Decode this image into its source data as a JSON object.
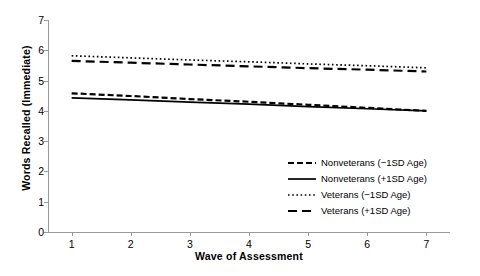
{
  "chart_data": {
    "type": "line",
    "title": "",
    "xlabel": "Wave of Assessment",
    "ylabel": "Words Recalled (Immediate)",
    "x": [
      1,
      2,
      3,
      4,
      5,
      6,
      7
    ],
    "xlim": [
      0.6,
      7.4
    ],
    "ylim": [
      0,
      7
    ],
    "xticks": [
      "1",
      "2",
      "3",
      "4",
      "5",
      "6",
      "7"
    ],
    "yticks": [
      "0",
      "1",
      "2",
      "3",
      "4",
      "5",
      "6",
      "7"
    ],
    "grid": false,
    "legend_position": "lower right",
    "series": [
      {
        "name": "Nonveterans (−1SD Age)",
        "style": "dashed",
        "color": "#000000",
        "values": [
          4.58,
          4.49,
          4.39,
          4.3,
          4.2,
          4.1,
          4.0
        ]
      },
      {
        "name": "Nonveterans (+1SD Age)",
        "style": "solid",
        "color": "#000000",
        "values": [
          4.43,
          4.36,
          4.29,
          4.22,
          4.14,
          4.07,
          4.0
        ]
      },
      {
        "name": "Veterans (−1SD Age)",
        "style": "dotted",
        "color": "#000000",
        "values": [
          5.82,
          5.75,
          5.68,
          5.62,
          5.55,
          5.49,
          5.42
        ]
      },
      {
        "name": "Veterans (+1SD Age)",
        "style": "long-dashed",
        "color": "#000000",
        "values": [
          5.65,
          5.59,
          5.53,
          5.47,
          5.41,
          5.36,
          5.3
        ]
      }
    ]
  },
  "legend": {
    "items": [
      {
        "label": "Nonveterans (−1SD Age)",
        "style": "dashed"
      },
      {
        "label": "Nonveterans (+1SD Age)",
        "style": "solid"
      },
      {
        "label": "Veterans (−1SD Age)",
        "style": "dotted"
      },
      {
        "label": "Veterans (+1SD Age)",
        "style": "long-dashed"
      }
    ]
  }
}
